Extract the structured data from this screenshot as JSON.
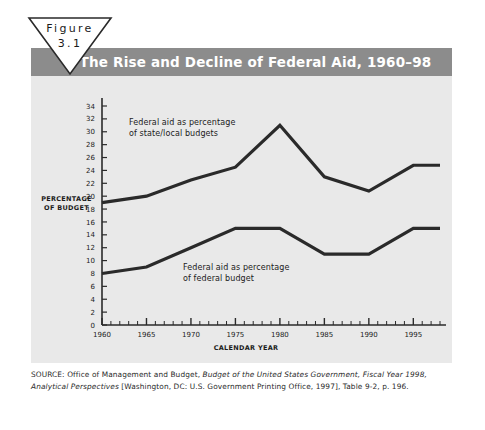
{
  "figure": {
    "label": "Figure",
    "number": "3.1"
  },
  "chart_title": "The Rise and Decline of Federal Aid, 1960–98",
  "colors": {
    "title_band": "#8c8c8c",
    "panel_background": "#e9e9e9",
    "line": "#2a2a2a",
    "page_background": "#ffffff",
    "text": "#1b1b1b"
  },
  "source": {
    "prefix": "SOURCE: Office of Management and Budget, ",
    "italic1": "Budget of the United States Government, Fiscal Year 1998, Analytical Perspectives",
    "suffix": " [Washington, DC: U.S. Government Printing Office, 1997], Table 9-2, p. 196."
  },
  "chart_data": {
    "type": "line",
    "title": "The Rise and Decline of Federal Aid, 1960–98",
    "xlabel": "CALENDAR YEAR",
    "ylabel": "PERCENTAGE OF BUDGET",
    "xlim": [
      1960,
      1998
    ],
    "ylim": [
      0,
      34
    ],
    "ytick_step": 2,
    "yticks": [
      0,
      2,
      4,
      6,
      8,
      10,
      12,
      14,
      16,
      18,
      20,
      22,
      24,
      26,
      28,
      30,
      32,
      34
    ],
    "xticks_major": [
      1960,
      1965,
      1970,
      1975,
      1980,
      1985,
      1990,
      1995
    ],
    "xtick_minor_step": 1,
    "grid": false,
    "legend": "annotations",
    "series": [
      {
        "name": "Federal aid as percentage of state/local budgets",
        "annotation_lines": [
          "Federal aid as percentage",
          "of state/local budgets"
        ],
        "x": [
          1960,
          1965,
          1970,
          1975,
          1980,
          1985,
          1990,
          1995,
          1998
        ],
        "values": [
          19.0,
          20.0,
          22.5,
          24.5,
          31.0,
          23.0,
          20.8,
          24.8,
          24.8
        ]
      },
      {
        "name": "Federal aid as percentage of federal budget",
        "annotation_lines": [
          "Federal aid as percentage",
          "of federal budget"
        ],
        "x": [
          1960,
          1965,
          1970,
          1975,
          1980,
          1985,
          1990,
          1995,
          1998
        ],
        "values": [
          8.0,
          9.0,
          12.0,
          15.0,
          15.0,
          11.0,
          11.0,
          15.0,
          15.0
        ]
      }
    ]
  }
}
